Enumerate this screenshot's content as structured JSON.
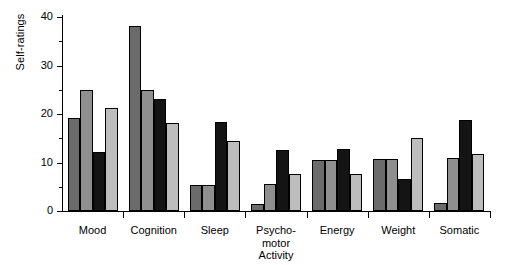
{
  "chart_data": {
    "type": "bar",
    "title": "",
    "subtitle": "",
    "xlabel": "",
    "ylabel": "Self-ratings",
    "ylim": [
      0,
      40
    ],
    "yticks": [
      0,
      10,
      20,
      30,
      40
    ],
    "ytick_labels": [
      "0",
      "10",
      "20",
      "30",
      "40"
    ],
    "yminor_ticks": [
      5,
      15,
      25,
      35
    ],
    "grid": false,
    "legend": false,
    "legend_position": "none",
    "categories": [
      "Mood",
      "Cognition",
      "Sleep",
      "Psycho-\nmotor\nActivity",
      "Energy",
      "Weight",
      "Somatic"
    ],
    "series": [
      {
        "name": "series-1",
        "color": "#6b6b6b",
        "values": [
          19.1,
          38.2,
          5.3,
          1.5,
          10.6,
          10.7,
          1.7
        ]
      },
      {
        "name": "series-2",
        "color": "#8f8f8f",
        "values": [
          24.9,
          24.9,
          5.3,
          5.5,
          10.6,
          10.7,
          10.9
        ]
      },
      {
        "name": "series-3",
        "color": "#141414",
        "values": [
          12.1,
          23.0,
          18.4,
          12.5,
          12.7,
          6.5,
          18.7
        ]
      },
      {
        "name": "series-4",
        "color": "#bdbdbd",
        "values": [
          21.3,
          18.2,
          14.5,
          7.7,
          7.7,
          15.0,
          11.8
        ]
      }
    ]
  },
  "axes": {
    "y_title": "Self-ratings"
  }
}
